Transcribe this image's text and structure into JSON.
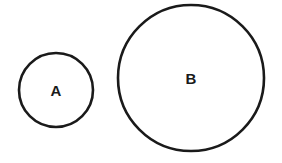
{
  "diagram": {
    "stroke_color": "#1a1a1a",
    "background": "#ffffff",
    "circles": [
      {
        "label": "A",
        "cx": 56,
        "cy": 90,
        "r": 37
      },
      {
        "label": "B",
        "cx": 191,
        "cy": 78,
        "r": 73
      }
    ]
  }
}
